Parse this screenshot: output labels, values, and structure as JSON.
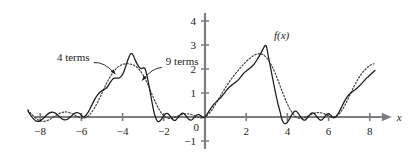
{
  "chart_data": {
    "type": "line",
    "title": "",
    "subtitle": "",
    "xlabel": "x",
    "ylabel": "",
    "xlim": [
      -8.8,
      8.6
    ],
    "ylim": [
      -1.4,
      4.4
    ],
    "grid": false,
    "legend_position": "inline-annotations",
    "x_ticks": [
      -8,
      -6,
      -4,
      -2,
      0,
      2,
      4,
      6,
      8
    ],
    "x_tick_labels": [
      "−8",
      "−6",
      "−4",
      "−2",
      "0",
      "2",
      "4",
      "6",
      "8"
    ],
    "y_ticks": [
      -1,
      0,
      1,
      2,
      3,
      4
    ],
    "y_tick_labels": [
      "−1",
      "0",
      "1",
      "2",
      "3",
      "4"
    ],
    "annotations": [
      {
        "id": "four-terms",
        "text": "4 terms",
        "x": -5.6,
        "y": 2.35,
        "points_to": [
          -4.35,
          1.78
        ]
      },
      {
        "id": "nine-terms",
        "text": "9 terms",
        "x": -1.9,
        "y": 2.15,
        "points_to": [
          -3.05,
          1.52
        ]
      },
      {
        "id": "function-label",
        "text": "f(x)",
        "x": 3.35,
        "y": 3.25,
        "italic": true
      }
    ],
    "series": [
      {
        "name": "4 terms",
        "style": "dotted",
        "color": "#3a3a3a",
        "points": [
          [
            -8.6,
            0.3
          ],
          [
            -8.4,
            0.1
          ],
          [
            -8.2,
            -0.06
          ],
          [
            -8.0,
            -0.16
          ],
          [
            -7.8,
            -0.18
          ],
          [
            -7.6,
            -0.13
          ],
          [
            -7.4,
            -0.03
          ],
          [
            -7.2,
            0.08
          ],
          [
            -7.0,
            0.17
          ],
          [
            -6.8,
            0.21
          ],
          [
            -6.6,
            0.19
          ],
          [
            -6.4,
            0.11
          ],
          [
            -6.2,
            0.02
          ],
          [
            -6.0,
            -0.04
          ],
          [
            -5.8,
            -0.03
          ],
          [
            -5.6,
            0.1
          ],
          [
            -5.4,
            0.33
          ],
          [
            -5.2,
            0.64
          ],
          [
            -5.0,
            1.0
          ],
          [
            -4.8,
            1.36
          ],
          [
            -4.6,
            1.68
          ],
          [
            -4.4,
            1.93
          ],
          [
            -4.2,
            2.1
          ],
          [
            -4.0,
            2.19
          ],
          [
            -3.8,
            2.22
          ],
          [
            -3.6,
            2.2
          ],
          [
            -3.4,
            2.13
          ],
          [
            -3.2,
            1.98
          ],
          [
            -3.0,
            1.74
          ],
          [
            -2.8,
            1.4
          ],
          [
            -2.6,
            1.0
          ],
          [
            -2.4,
            0.6
          ],
          [
            -2.2,
            0.27
          ],
          [
            -2.0,
            0.05
          ],
          [
            -1.8,
            -0.05
          ],
          [
            -1.6,
            -0.05
          ],
          [
            -1.4,
            0.01
          ],
          [
            -1.2,
            0.08
          ],
          [
            -1.0,
            0.13
          ],
          [
            -0.8,
            0.13
          ],
          [
            -0.6,
            0.08
          ],
          [
            -0.4,
            0.01
          ],
          [
            -0.2,
            -0.04
          ],
          [
            0.0,
            0.0
          ],
          [
            0.2,
            0.15
          ],
          [
            0.4,
            0.38
          ],
          [
            0.6,
            0.66
          ],
          [
            0.8,
            0.95
          ],
          [
            1.0,
            1.23
          ],
          [
            1.2,
            1.49
          ],
          [
            1.4,
            1.72
          ],
          [
            1.6,
            1.93
          ],
          [
            1.8,
            2.13
          ],
          [
            2.0,
            2.31
          ],
          [
            2.2,
            2.46
          ],
          [
            2.4,
            2.58
          ],
          [
            2.6,
            2.63
          ],
          [
            2.8,
            2.6
          ],
          [
            3.0,
            2.46
          ],
          [
            3.2,
            2.2
          ],
          [
            3.4,
            1.84
          ],
          [
            3.6,
            1.4
          ],
          [
            3.8,
            0.95
          ],
          [
            4.0,
            0.54
          ],
          [
            4.2,
            0.22
          ],
          [
            4.4,
            0.02
          ],
          [
            4.6,
            -0.06
          ],
          [
            4.8,
            -0.04
          ],
          [
            5.0,
            0.04
          ],
          [
            5.2,
            0.12
          ],
          [
            5.4,
            0.18
          ],
          [
            5.6,
            0.18
          ],
          [
            5.8,
            0.13
          ],
          [
            6.0,
            0.05
          ],
          [
            6.2,
            0.0
          ],
          [
            6.4,
            0.05
          ],
          [
            6.6,
            0.22
          ],
          [
            6.8,
            0.5
          ],
          [
            7.0,
            0.86
          ],
          [
            7.2,
            1.22
          ],
          [
            7.4,
            1.54
          ],
          [
            7.6,
            1.8
          ],
          [
            7.8,
            2.0
          ],
          [
            8.0,
            2.14
          ],
          [
            8.2,
            2.22
          ]
        ]
      },
      {
        "name": "9 terms",
        "style": "solid",
        "color": "#1a1a1a",
        "points": [
          [
            -8.6,
            0.26
          ],
          [
            -8.45,
            0.06
          ],
          [
            -8.3,
            -0.1
          ],
          [
            -8.15,
            -0.18
          ],
          [
            -8.0,
            -0.16
          ],
          [
            -7.85,
            -0.06
          ],
          [
            -7.7,
            0.07
          ],
          [
            -7.55,
            0.17
          ],
          [
            -7.4,
            0.2
          ],
          [
            -7.25,
            0.15
          ],
          [
            -7.1,
            0.04
          ],
          [
            -6.95,
            -0.07
          ],
          [
            -6.8,
            -0.12
          ],
          [
            -6.65,
            -0.08
          ],
          [
            -6.5,
            0.03
          ],
          [
            -6.35,
            0.14
          ],
          [
            -6.2,
            0.18
          ],
          [
            -6.05,
            0.12
          ],
          [
            -5.95,
            0.02
          ],
          [
            -5.85,
            0.02
          ],
          [
            -5.7,
            0.16
          ],
          [
            -5.55,
            0.4
          ],
          [
            -5.4,
            0.66
          ],
          [
            -5.25,
            0.88
          ],
          [
            -5.1,
            1.03
          ],
          [
            -4.95,
            1.12
          ],
          [
            -4.8,
            1.2
          ],
          [
            -4.7,
            1.3
          ],
          [
            -4.6,
            1.44
          ],
          [
            -4.5,
            1.56
          ],
          [
            -4.4,
            1.62
          ],
          [
            -4.3,
            1.62
          ],
          [
            -4.2,
            1.62
          ],
          [
            -4.1,
            1.66
          ],
          [
            -4.0,
            1.78
          ],
          [
            -3.9,
            1.98
          ],
          [
            -3.8,
            2.24
          ],
          [
            -3.7,
            2.48
          ],
          [
            -3.62,
            2.62
          ],
          [
            -3.55,
            2.64
          ],
          [
            -3.48,
            2.56
          ],
          [
            -3.4,
            2.4
          ],
          [
            -3.3,
            2.22
          ],
          [
            -3.2,
            2.08
          ],
          [
            -3.1,
            2.02
          ],
          [
            -3.02,
            2.04
          ],
          [
            -2.95,
            2.05
          ],
          [
            -2.88,
            1.94
          ],
          [
            -2.8,
            1.66
          ],
          [
            -2.7,
            1.22
          ],
          [
            -2.6,
            0.74
          ],
          [
            -2.5,
            0.3
          ],
          [
            -2.4,
            -0.02
          ],
          [
            -2.3,
            -0.18
          ],
          [
            -2.2,
            -0.18
          ],
          [
            -2.1,
            -0.08
          ],
          [
            -2.0,
            0.05
          ],
          [
            -1.9,
            0.14
          ],
          [
            -1.8,
            0.14
          ],
          [
            -1.7,
            0.05
          ],
          [
            -1.6,
            -0.07
          ],
          [
            -1.5,
            -0.14
          ],
          [
            -1.4,
            -0.11
          ],
          [
            -1.3,
            -0.01
          ],
          [
            -1.2,
            0.1
          ],
          [
            -1.1,
            0.16
          ],
          [
            -1.0,
            0.13
          ],
          [
            -0.9,
            0.03
          ],
          [
            -0.8,
            -0.08
          ],
          [
            -0.7,
            -0.13
          ],
          [
            -0.6,
            -0.09
          ],
          [
            -0.5,
            0.0
          ],
          [
            -0.4,
            0.08
          ],
          [
            -0.3,
            0.1
          ],
          [
            -0.2,
            0.05
          ],
          [
            -0.1,
            -0.02
          ],
          [
            0.0,
            0.0
          ],
          [
            0.15,
            0.18
          ],
          [
            0.3,
            0.38
          ],
          [
            0.45,
            0.55
          ],
          [
            0.6,
            0.68
          ],
          [
            0.75,
            0.8
          ],
          [
            0.9,
            0.95
          ],
          [
            1.05,
            1.12
          ],
          [
            1.2,
            1.26
          ],
          [
            1.35,
            1.36
          ],
          [
            1.5,
            1.46
          ],
          [
            1.65,
            1.58
          ],
          [
            1.8,
            1.74
          ],
          [
            1.95,
            1.88
          ],
          [
            2.1,
            1.98
          ],
          [
            2.25,
            2.08
          ],
          [
            2.4,
            2.22
          ],
          [
            2.55,
            2.42
          ],
          [
            2.7,
            2.64
          ],
          [
            2.82,
            2.84
          ],
          [
            2.9,
            2.96
          ],
          [
            2.96,
            2.98
          ],
          [
            3.0,
            2.88
          ],
          [
            3.06,
            2.6
          ],
          [
            3.15,
            2.2
          ],
          [
            3.25,
            1.76
          ],
          [
            3.35,
            1.32
          ],
          [
            3.45,
            0.9
          ],
          [
            3.55,
            0.52
          ],
          [
            3.65,
            0.2
          ],
          [
            3.72,
            -0.06
          ],
          [
            3.8,
            -0.22
          ],
          [
            3.9,
            -0.28
          ],
          [
            4.0,
            -0.22
          ],
          [
            4.1,
            -0.08
          ],
          [
            4.2,
            0.08
          ],
          [
            4.3,
            0.2
          ],
          [
            4.4,
            0.24
          ],
          [
            4.5,
            0.18
          ],
          [
            4.6,
            0.06
          ],
          [
            4.7,
            -0.06
          ],
          [
            4.8,
            -0.13
          ],
          [
            4.9,
            -0.1
          ],
          [
            5.0,
            0.0
          ],
          [
            5.1,
            0.11
          ],
          [
            5.2,
            0.17
          ],
          [
            5.3,
            0.15
          ],
          [
            5.4,
            0.05
          ],
          [
            5.5,
            -0.06
          ],
          [
            5.6,
            -0.13
          ],
          [
            5.7,
            -0.1
          ],
          [
            5.8,
            0.0
          ],
          [
            5.9,
            0.1
          ],
          [
            6.0,
            0.14
          ],
          [
            6.1,
            0.08
          ],
          [
            6.2,
            -0.02
          ],
          [
            6.3,
            -0.02
          ],
          [
            6.45,
            0.12
          ],
          [
            6.6,
            0.36
          ],
          [
            6.75,
            0.62
          ],
          [
            6.9,
            0.84
          ],
          [
            7.05,
            0.98
          ],
          [
            7.2,
            1.08
          ],
          [
            7.35,
            1.18
          ],
          [
            7.5,
            1.3
          ],
          [
            7.65,
            1.44
          ],
          [
            7.8,
            1.58
          ],
          [
            7.95,
            1.7
          ],
          [
            8.1,
            1.82
          ],
          [
            8.25,
            1.94
          ]
        ]
      }
    ]
  }
}
